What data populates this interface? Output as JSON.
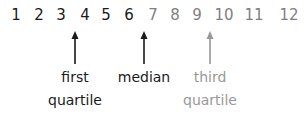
{
  "numbers": [
    {
      "value": "1",
      "x": 16,
      "color": "#1a1a1a"
    },
    {
      "value": "2",
      "x": 39,
      "color": "#1a1a1a"
    },
    {
      "value": "3",
      "x": 61,
      "color": "#1a1a1a"
    },
    {
      "value": "4",
      "x": 85,
      "color": "#1a1a1a"
    },
    {
      "value": "5",
      "x": 106,
      "color": "#1a1a1a"
    },
    {
      "value": "6",
      "x": 129,
      "color": "#1a1a1a"
    },
    {
      "value": "7",
      "x": 153,
      "color": "#7f7f7f"
    },
    {
      "value": "8",
      "x": 175,
      "color": "#7f7f7f"
    },
    {
      "value": "9",
      "x": 197,
      "color": "#7f7f7f"
    },
    {
      "value": "10",
      "x": 224,
      "color": "#7f7f7f"
    },
    {
      "value": "11",
      "x": 254,
      "color": "#7f7f7f"
    },
    {
      "value": "12",
      "x": 289,
      "color": "#7f7f7f"
    }
  ],
  "markers": [
    {
      "label_line1": "first",
      "label_line2": "quartile",
      "x": 75,
      "color": "#1a1a1a"
    },
    {
      "label_line1": "median",
      "label_line2": "",
      "x": 144,
      "color": "#1a1a1a"
    },
    {
      "label_line1": "third",
      "label_line2": "quartile",
      "x": 210,
      "color": "#999999"
    }
  ]
}
